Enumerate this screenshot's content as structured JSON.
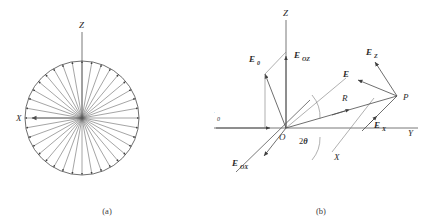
{
  "figure": {
    "panels": [
      {
        "id": "a",
        "caption": "(a)",
        "description": "radial-dipole-pattern",
        "axes": [
          {
            "name": "z-axis",
            "label": "Z"
          },
          {
            "name": "x-axis",
            "label": "X"
          }
        ],
        "spoke_count": 36,
        "circle": {
          "cx": 82,
          "cy": 118,
          "r": 57
        }
      },
      {
        "id": "b",
        "caption": "(b)",
        "description": "scattering-vector-geometry",
        "axes": [
          {
            "name": "z-axis",
            "label": "Z"
          },
          {
            "name": "x-axis",
            "label": "X"
          },
          {
            "name": "y-axis",
            "label": "Y"
          }
        ],
        "origin_label": "O",
        "point_label": "P",
        "incident_beam_label": "I",
        "incident_beam_sub": "0",
        "distance_label": "R",
        "angle_label_prefix": "2",
        "angle_label_symbol": "θ",
        "vectors": [
          {
            "name": "E0",
            "label": "E",
            "sub": "0"
          },
          {
            "name": "EOZ",
            "label": "E",
            "sub": "OZ"
          },
          {
            "name": "EOX",
            "label": "E",
            "sub": "OX"
          },
          {
            "name": "E",
            "label": "E",
            "sub": ""
          },
          {
            "name": "EZ",
            "label": "E",
            "sub": "Z"
          },
          {
            "name": "EX",
            "label": "E",
            "sub": "X"
          }
        ]
      }
    ]
  },
  "colors": {
    "ink": "#2b2b2b",
    "line": "#4a4a4a",
    "axis": "#6a6a6a",
    "background": "#ffffff"
  }
}
